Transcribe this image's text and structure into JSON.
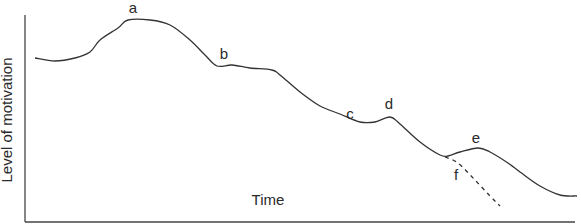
{
  "chart_data": {
    "type": "line",
    "title": "",
    "xlabel": "Time",
    "ylabel": "Level of motivation",
    "grid": false,
    "legend": null,
    "series": [
      {
        "name": "motivation",
        "style": "solid",
        "points": [
          [
            35,
            58
          ],
          [
            55,
            61
          ],
          [
            75,
            58
          ],
          [
            90,
            52
          ],
          [
            100,
            40
          ],
          [
            118,
            28
          ],
          [
            128,
            20
          ],
          [
            150,
            20
          ],
          [
            170,
            25
          ],
          [
            190,
            40
          ],
          [
            205,
            55
          ],
          [
            217,
            66
          ],
          [
            232,
            65
          ],
          [
            250,
            68
          ],
          [
            272,
            70
          ],
          [
            280,
            75
          ],
          [
            300,
            92
          ],
          [
            320,
            106
          ],
          [
            340,
            114
          ],
          [
            360,
            122
          ],
          [
            375,
            122
          ],
          [
            390,
            117
          ],
          [
            400,
            124
          ],
          [
            420,
            142
          ],
          [
            440,
            155
          ],
          [
            448,
            156
          ],
          [
            460,
            152
          ],
          [
            478,
            148
          ],
          [
            490,
            152
          ],
          [
            508,
            163
          ],
          [
            520,
            172
          ],
          [
            540,
            186
          ],
          [
            560,
            195
          ],
          [
            577,
            196
          ]
        ]
      },
      {
        "name": "alternative-decline",
        "style": "dashed",
        "points": [
          [
            445,
            157
          ],
          [
            458,
            163
          ],
          [
            475,
            180
          ],
          [
            490,
            196
          ],
          [
            500,
            206
          ]
        ]
      }
    ],
    "annotations": [
      {
        "label": "a",
        "x": 133,
        "y": 13
      },
      {
        "label": "b",
        "x": 224,
        "y": 59
      },
      {
        "label": "c",
        "x": 350,
        "y": 119
      },
      {
        "label": "d",
        "x": 389,
        "y": 109
      },
      {
        "label": "e",
        "x": 476,
        "y": 143
      },
      {
        "label": "f",
        "x": 456,
        "y": 180
      }
    ]
  },
  "labels": {
    "x_axis": "Time",
    "y_axis": "Level of motivation",
    "a": "a",
    "b": "b",
    "c": "c",
    "d": "d",
    "e": "e",
    "f": "f"
  }
}
